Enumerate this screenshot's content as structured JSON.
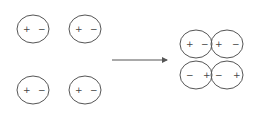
{
  "diagram": {
    "left_dipoles": [
      {
        "cx": 33,
        "cy": 29,
        "left_sign": "+",
        "right_sign": "−"
      },
      {
        "cx": 85,
        "cy": 29,
        "left_sign": "+",
        "right_sign": "−"
      },
      {
        "cx": 33,
        "cy": 90,
        "left_sign": "+",
        "right_sign": "−"
      },
      {
        "cx": 85,
        "cy": 90,
        "left_sign": "+",
        "right_sign": "−"
      }
    ],
    "arrow": {
      "x1": 112,
      "y1": 60,
      "x2": 167,
      "y2": 60
    },
    "right_dipoles": [
      {
        "cx": 196,
        "cy": 44,
        "left_sign": "+",
        "right_sign": "−"
      },
      {
        "cx": 227,
        "cy": 44,
        "left_sign": "+",
        "right_sign": "−"
      },
      {
        "cx": 196,
        "cy": 75,
        "left_sign": "−",
        "right_sign": "+"
      },
      {
        "cx": 227,
        "cy": 75,
        "left_sign": "−",
        "right_sign": "+"
      }
    ],
    "stroke_color": "#555555"
  }
}
